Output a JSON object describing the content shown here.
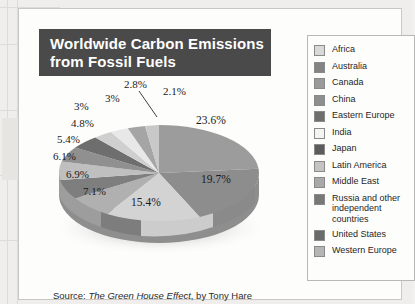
{
  "title": {
    "line1": "Worldwide Carbon Emissions",
    "line2": "from Fossil Fuels"
  },
  "source": {
    "prefix": "Source: ",
    "book": "The Green House Effect",
    "suffix": ", by Tony Hare"
  },
  "legend": {
    "items": [
      {
        "label": "Africa",
        "color": "#d9d9d9"
      },
      {
        "label": "Australia",
        "color": "#848484"
      },
      {
        "label": "Canada",
        "color": "#9a9a9a"
      },
      {
        "label": "China",
        "color": "#8e8e8e"
      },
      {
        "label": "Eastern Europe",
        "color": "#6f6f6f"
      },
      {
        "label": "India",
        "color": "#f4f4f2"
      },
      {
        "label": "Japan",
        "color": "#5c5c5c"
      },
      {
        "label": "Latin America",
        "color": "#c4c4c4"
      },
      {
        "label": "Middle East",
        "color": "#a9a9a9"
      },
      {
        "label": "Russia and other",
        "label2": "independent countries",
        "color": "#787878"
      },
      {
        "label": "United States",
        "color": "#6a6a6a"
      },
      {
        "label": "Western Europe",
        "color": "#b5b5b5"
      }
    ]
  },
  "chart_data": {
    "type": "pie",
    "title": "Worldwide Carbon Emissions from Fossil Fuels",
    "legend_position": "right",
    "labels": [
      "United States",
      "Russia and other independent countries",
      "Western Europe",
      "China",
      "Japan",
      "Eastern Europe",
      "Canada",
      "Middle East",
      "Australia",
      "Latin America",
      "India",
      "Africa"
    ],
    "values": [
      23.6,
      19.7,
      15.4,
      7.1,
      6.9,
      6.1,
      5.4,
      4.8,
      3,
      3,
      2.8,
      2.1
    ],
    "value_labels": [
      "23.6%",
      "19.7%",
      "15.4%",
      "7.1%",
      "6.9%",
      "6.1%",
      "5.4%",
      "4.8%",
      "3%",
      "3%",
      "2.8%",
      "2.1%"
    ],
    "colors": [
      "#9c9c9c",
      "#8d8d8d",
      "#d3d3d3",
      "#b0b0b0",
      "#7e7e7e",
      "#bfbfbf",
      "#909090",
      "#6e6e6e",
      "#cfcfcf",
      "#e8e8e8",
      "#a5a5a5",
      "#c8c8c8"
    ],
    "unit": "percent"
  },
  "slice_labels": {
    "s236": "23.6%",
    "s197": "19.7%",
    "s154": "15.4%",
    "s71": "7.1%",
    "s69": "6.9%",
    "s61": "6.1%",
    "s54": "5.4%",
    "s48": "4.8%",
    "s3a": "3%",
    "s3b": "3%",
    "s28": "2.8%",
    "s21": "2.1%"
  }
}
